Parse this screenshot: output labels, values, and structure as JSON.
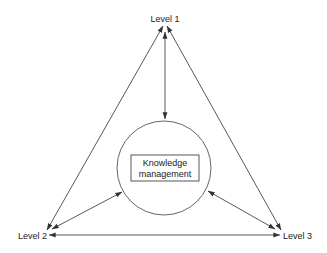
{
  "diagram": {
    "type": "triangle-hub",
    "nodes": {
      "level1": "Level 1",
      "level2": "Level 2",
      "level3": "Level 3",
      "center_line1": "Knowledge",
      "center_line2": "management"
    },
    "edges": [
      {
        "from": "Level 1",
        "to": "Level 2",
        "bidirectional": true
      },
      {
        "from": "Level 1",
        "to": "Level 3",
        "bidirectional": true
      },
      {
        "from": "Level 2",
        "to": "Level 3",
        "bidirectional": true
      },
      {
        "from": "Level 1",
        "to": "Knowledge management",
        "bidirectional": true
      },
      {
        "from": "Level 2",
        "to": "Knowledge management",
        "bidirectional": true
      },
      {
        "from": "Level 3",
        "to": "Knowledge management",
        "bidirectional": true
      }
    ],
    "colors": {
      "line": "#444444",
      "text": "#222222",
      "background": "#ffffff"
    }
  }
}
